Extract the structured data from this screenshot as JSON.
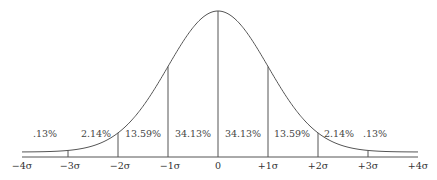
{
  "diagram": {
    "type": "normal-distribution",
    "axis_labels": [
      "−4σ",
      "−3σ",
      "−2σ",
      "−1σ",
      "0",
      "+1σ",
      "+2σ",
      "+3σ",
      "+4σ"
    ],
    "region_percentages": [
      ".13%",
      "2.14%",
      "13.59%",
      "34.13%",
      "34.13%",
      "13.59%",
      "2.14%",
      ".13%"
    ],
    "colors": {
      "line": "#555555",
      "text": "#333333",
      "background": "#ffffff"
    }
  }
}
